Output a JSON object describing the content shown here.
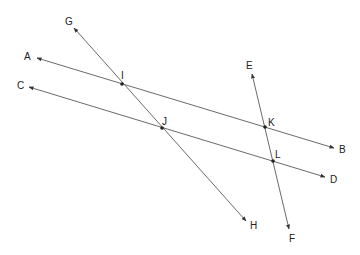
{
  "diagram": {
    "title": "",
    "type": "geometry",
    "stroke_color": "#6a6a6a",
    "labels": {
      "A": "A",
      "B": "B",
      "C": "C",
      "D": "D",
      "E": "E",
      "F": "F",
      "G": "G",
      "H": "H",
      "I": "I",
      "J": "J",
      "K": "K",
      "L": "L"
    },
    "lines": [
      {
        "name": "line-AB",
        "from": "A",
        "to": "B",
        "arrows": "both"
      },
      {
        "name": "line-CD",
        "from": "C",
        "to": "D",
        "arrows": "both"
      },
      {
        "name": "line-GH",
        "from": "G",
        "to": "H",
        "arrows": "both"
      },
      {
        "name": "line-EF",
        "from": "E",
        "to": "F",
        "arrows": "both"
      }
    ],
    "intersections": [
      {
        "point": "I",
        "lines": [
          "AB",
          "GH"
        ]
      },
      {
        "point": "J",
        "lines": [
          "CD",
          "GH"
        ]
      },
      {
        "point": "K",
        "lines": [
          "AB",
          "EF"
        ]
      },
      {
        "point": "L",
        "lines": [
          "CD",
          "EF"
        ]
      }
    ]
  }
}
